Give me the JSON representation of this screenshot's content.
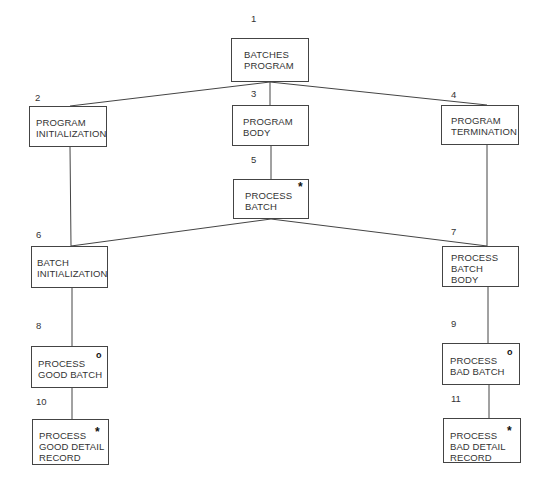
{
  "diagram": {
    "type": "jackson-structure-chart",
    "nodes": [
      {
        "id": "1",
        "lines": [
          "BATCHES",
          "PROGRAM"
        ],
        "marker": ""
      },
      {
        "id": "2",
        "lines": [
          "PROGRAM",
          "INITIALIZATION"
        ],
        "marker": ""
      },
      {
        "id": "3",
        "lines": [
          "PROGRAM",
          "BODY"
        ],
        "marker": ""
      },
      {
        "id": "4",
        "lines": [
          "PROGRAM",
          "TERMINATION"
        ],
        "marker": ""
      },
      {
        "id": "5",
        "lines": [
          "PROCESS",
          "BATCH"
        ],
        "marker": "*"
      },
      {
        "id": "6",
        "lines": [
          "BATCH",
          "INITIALIZATION"
        ],
        "marker": ""
      },
      {
        "id": "7",
        "lines": [
          "PROCESS",
          "BATCH",
          "BODY"
        ],
        "marker": ""
      },
      {
        "id": "8",
        "lines": [
          "PROCESS",
          "GOOD BATCH"
        ],
        "marker": "o"
      },
      {
        "id": "9",
        "lines": [
          "PROCESS",
          "BAD BATCH"
        ],
        "marker": "o"
      },
      {
        "id": "10",
        "lines": [
          "PROCESS",
          "GOOD DETAIL",
          "RECORD"
        ],
        "marker": "*"
      },
      {
        "id": "11",
        "lines": [
          "PROCESS",
          "BAD DETAIL",
          "RECORD"
        ],
        "marker": "*"
      }
    ],
    "edges": [
      [
        "1",
        "2"
      ],
      [
        "1",
        "3"
      ],
      [
        "1",
        "4"
      ],
      [
        "3",
        "5"
      ],
      [
        "5",
        "6"
      ],
      [
        "5",
        "7"
      ],
      [
        "6",
        "8"
      ],
      [
        "7",
        "9"
      ],
      [
        "8",
        "10"
      ],
      [
        "9",
        "11"
      ]
    ],
    "markers": {
      "iteration": "*",
      "selection": "o"
    }
  }
}
